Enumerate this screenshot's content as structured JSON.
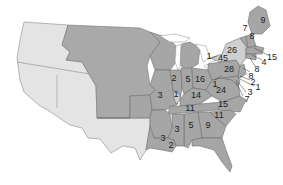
{
  "map": {
    "colors": {
      "state": "#a6a6a6",
      "state_light": "#cfcfcf",
      "territory": "#e4e4e4",
      "unorganized_territory": "#a9a9a9",
      "background": "#ffffff"
    },
    "labels": {
      "maine": "9",
      "new_hampshire": "7",
      "vermont": "8",
      "new_york": "26",
      "massachusetts": "15",
      "rhode_island": "4",
      "connecticut": "8",
      "new_jersey": "8",
      "delaware": "2",
      "maryland_dc": "1",
      "maryland": "3",
      "maryland_leader": "7",
      "michigan_a": "1",
      "michigan_b": "45",
      "pennsylvania": "28",
      "ohio": "16",
      "indiana": "5",
      "illinois": "2",
      "illinois_south": "1",
      "missouri": "3",
      "kentucky": "14",
      "virginia": "24",
      "north_carolina": "15",
      "tennessee": "11",
      "south_carolina": "11",
      "georgia": "9",
      "alabama": "5",
      "mississippi": "3",
      "arkansas": "3",
      "louisiana": "2",
      "virginia_west": "1"
    }
  }
}
